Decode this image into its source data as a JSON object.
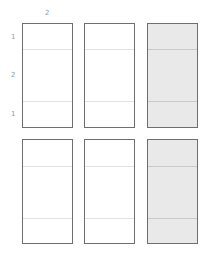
{
  "labels": {
    "top": "2",
    "left": [
      "1",
      "2",
      "1"
    ]
  },
  "colors": {
    "border": "#6e6e6e",
    "shaded_fill": "#e9e9e9",
    "divider": "#e2e2e2",
    "label": "#9a9a9a"
  },
  "grid": {
    "rows": 2,
    "cols": 3,
    "shaded_column": 3,
    "segments_per_box": [
      1,
      2,
      1
    ]
  }
}
